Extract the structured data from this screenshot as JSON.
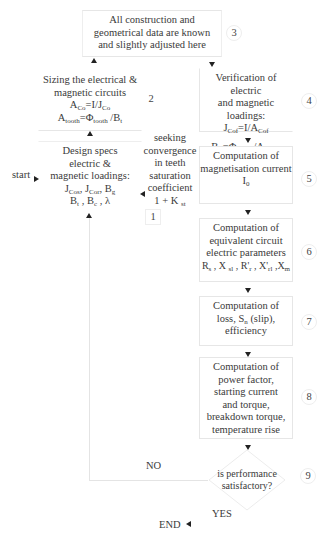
{
  "diagram": {
    "nodes": [
      {
        "id": "3",
        "number": "3",
        "lines": [
          "All construction and",
          "geometrical data are known",
          "and slightly adjusted here"
        ]
      },
      {
        "id": "2",
        "number": "2",
        "lines": [
          "Sizing the electrical &",
          "magnetic circuits"
        ],
        "formulas": [
          "A_Co = I/J_Co",
          "A_tooth = Φ_tooth / B_t"
        ]
      },
      {
        "id": "1",
        "number": "1",
        "lines": [
          "Design specs",
          "electric &",
          "magnetic loadings:"
        ],
        "formulas": [
          "J_Cos, J_Cor, B_g",
          "B_t , B_c , λ"
        ]
      },
      {
        "id": "4",
        "number": "4",
        "lines": [
          "Verification of electric",
          "and magnetic loadings:"
        ],
        "formulas": [
          "J_Cof = I/A_Cof",
          "B_t = Φ_tooth / A_toothf"
        ]
      },
      {
        "id": "5",
        "number": "5",
        "lines": [
          "Computation of",
          "magnetisation current"
        ],
        "formulas": [
          "I_0"
        ]
      },
      {
        "id": "6",
        "number": "6",
        "lines": [
          "Computation of",
          "equivalent circuit",
          "electric parameters"
        ],
        "formulas": [
          "R_s , X_sl , R'_r , X'_rl , X_m"
        ]
      },
      {
        "id": "7",
        "number": "7",
        "lines": [
          "Computation of",
          "loss, S_n (slip),",
          "efficiency"
        ]
      },
      {
        "id": "8",
        "number": "8",
        "lines": [
          "Computation of",
          "power factor,",
          "starting current",
          "and torque,",
          "breakdown torque,",
          "temperature rise"
        ]
      },
      {
        "id": "9",
        "number": "9",
        "type": "decision",
        "lines": [
          "is performance",
          "satisfactory?"
        ]
      }
    ],
    "labels": {
      "start": "start",
      "end": "END",
      "yes": "YES",
      "no": "NO",
      "feedback": [
        "seeking",
        "convergence",
        "in teeth",
        "saturation",
        "coefficient"
      ],
      "feedback_formula": "1 + K_st"
    },
    "text": {
      "n3": [
        "All construction and",
        "geometrical data are known",
        "and slightly adjusted here"
      ],
      "n2": [
        "Sizing the electrical &",
        "magnetic circuits"
      ],
      "n2_f1_main": "A",
      "n2_f1_sub": "Co",
      "n2_f1_rest": "=I/J",
      "n2_f1_sub2": "Co",
      "n2_f2_main": "A",
      "n2_f2_sub": "tooth",
      "n2_f2_rest": "=Φ",
      "n2_f2_sub2": "tooth",
      "n2_f2_end": " /B",
      "n2_f2_sub3": "t",
      "n1": [
        "Design specs",
        "electric &",
        "magnetic loadings:"
      ],
      "n1_f1": [
        "J",
        "Cos",
        ", J",
        "Cor",
        ", B",
        "g"
      ],
      "n1_f2": [
        "B",
        "t",
        " , B",
        "c",
        " , λ"
      ],
      "n4": [
        "Verification of electric",
        "and magnetic loadings:"
      ],
      "n4_f1": [
        "J",
        "Cof",
        "=I/A",
        "Cof"
      ],
      "n4_f2": [
        "B",
        "t",
        " =Φ",
        "tooth",
        " /A",
        "toothf"
      ],
      "n5": [
        "Computation of",
        "magnetisation current"
      ],
      "n5_f": [
        "I",
        "0"
      ],
      "n6": [
        "Computation of",
        "equivalent circuit",
        "electric parameters"
      ],
      "n6_f": [
        "R",
        "s",
        " , X ",
        "sl",
        " , R'",
        "r",
        " , X'",
        "rl",
        " ,X",
        "m"
      ],
      "n7": [
        "Computation of",
        "loss, S",
        "n",
        " (slip),",
        "efficiency"
      ],
      "n8": [
        "Computation of",
        "power factor,",
        "starting current",
        "and torque,",
        "breakdown torque,",
        "temperature rise"
      ],
      "n9": [
        "is performance",
        "satisfactory?"
      ],
      "fb": [
        "seeking",
        "convergence",
        "in teeth",
        "saturation",
        "coefficient"
      ],
      "fb_f": [
        "1 + K ",
        "st"
      ]
    }
  }
}
